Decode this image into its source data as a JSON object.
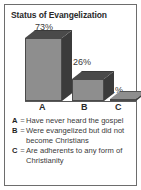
{
  "chart_data": {
    "type": "bar",
    "title": "Status of Evangelization",
    "categories": [
      "A",
      "B",
      "C"
    ],
    "values": [
      73,
      26,
      1
    ],
    "data_labels": [
      "73%",
      "26%",
      "1%"
    ],
    "xlabel": "",
    "ylabel": "",
    "ylim": [
      0,
      100
    ],
    "grid": false,
    "legend_position": "below",
    "style": "3d-bar",
    "legend": [
      {
        "key": "A",
        "separator": "=",
        "text": "Have never heard the gospel"
      },
      {
        "key": "B",
        "separator": "=",
        "text": "Were evangelized but did not become Christians"
      },
      {
        "key": "C",
        "separator": "=",
        "text": "Are adherents to any form of Christianity"
      }
    ]
  },
  "colors": {
    "bar_front": "#8e8e8e",
    "bar_side": "#3b3b3b",
    "bar_top": "#4a4a4a",
    "frame_border": "#6d6d6d",
    "background": "#ffffff",
    "title_text": "#2a2a2a",
    "body_text": "#3a3a3a"
  }
}
